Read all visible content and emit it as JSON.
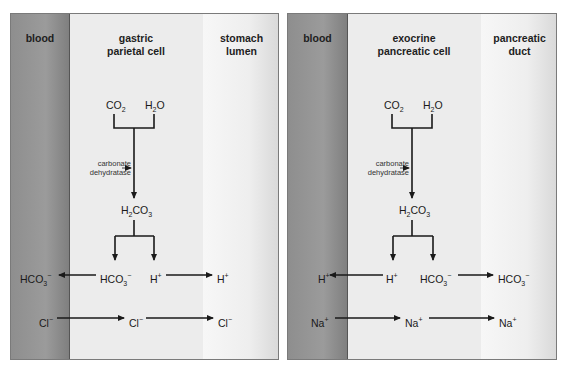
{
  "panels": [
    {
      "id": "gastric",
      "zones": {
        "blood": "blood",
        "cell": "gastric parietal cell",
        "lumen": "stomach lumen"
      },
      "cell_line1": "gastric",
      "cell_line2": "parietal cell",
      "lumen_line1": "stomach",
      "lumen_line2": "lumen",
      "reactants": [
        "CO2",
        "H2O"
      ],
      "enzyme_line1": "carbonate",
      "enzyme_line2": "dehydratase",
      "intermediate": "H2CO3",
      "products": [
        "HCO3−",
        "H+"
      ],
      "transport": [
        {
          "from": "HCO3− (cell)",
          "to": "HCO3− (blood)"
        },
        {
          "from": "H+ (cell)",
          "to": "H+ (lumen)"
        },
        {
          "from": "Cl− (blood)",
          "to": "Cl− (cell)"
        },
        {
          "from": "Cl− (cell)",
          "to": "Cl− (lumen)"
        }
      ]
    },
    {
      "id": "pancreatic",
      "zones": {
        "blood": "blood",
        "cell": "exocrine pancreatic cell",
        "lumen": "pancreatic duct"
      },
      "cell_line1": "exocrine",
      "cell_line2": "pancreatic cell",
      "lumen_line1": "pancreatic",
      "lumen_line2": "duct",
      "reactants": [
        "CO2",
        "H2O"
      ],
      "enzyme_line1": "carbonate",
      "enzyme_line2": "dehydratase",
      "intermediate": "H2CO3",
      "products": [
        "H+",
        "HCO3−"
      ],
      "transport": [
        {
          "from": "H+ (cell)",
          "to": "H+ (blood)"
        },
        {
          "from": "HCO3− (cell)",
          "to": "HCO3− (duct)"
        },
        {
          "from": "Na+ (blood)",
          "to": "Na+ (cell)"
        },
        {
          "from": "Na+ (cell)",
          "to": "Na+ (duct)"
        }
      ]
    }
  ],
  "labels": {
    "blood": "blood",
    "co2": "CO",
    "co2_sub": "2",
    "h2o_a": "H",
    "h2o_sub": "2",
    "h2o_b": "O",
    "h2co3_a": "H",
    "h2co3_sub1": "2",
    "h2co3_b": "CO",
    "h2co3_sub2": "3",
    "hco3": "HCO",
    "hco3_sub": "3",
    "minus": "−",
    "h": "H",
    "plus": "+",
    "cl": "Cl",
    "na": "Na"
  },
  "colors": {
    "blood": "#8e8e8e",
    "cell": "#ececec",
    "lumen": "#f4f4f4",
    "arrow": "#1a1a1a"
  }
}
